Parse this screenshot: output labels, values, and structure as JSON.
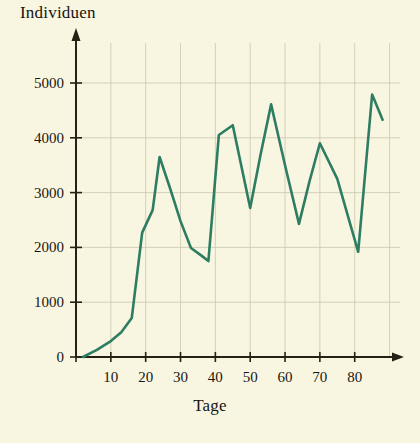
{
  "chart_data": {
    "type": "line",
    "title": "",
    "xlabel": "Tage",
    "ylabel": "Individuen",
    "xlim": [
      0,
      93
    ],
    "ylim": [
      0,
      5600
    ],
    "grid": true,
    "legend": null,
    "line_color": "#2e7d62",
    "background_color": "#f8f6e1",
    "axis_color": "#262015",
    "grid_color": "#c9c8ad",
    "text_color": "#1a1712",
    "xticks": [
      10,
      20,
      30,
      40,
      50,
      60,
      70,
      80
    ],
    "yticks": [
      0,
      1000,
      2000,
      3000,
      4000,
      5000
    ],
    "xtick_labels": [
      "10",
      "20",
      "30",
      "40",
      "50",
      "60",
      "70",
      "80"
    ],
    "ytick_labels": [
      "0",
      "1000",
      "2000",
      "3000",
      "4000",
      "5000"
    ],
    "series": [
      {
        "name": "Individuen",
        "x": [
          2,
          6,
          10,
          13,
          16,
          19,
          22,
          24,
          27,
          30,
          33,
          36,
          38,
          39,
          41,
          45,
          50,
          53,
          56,
          60,
          64,
          67,
          70,
          75,
          81,
          85,
          88
        ],
        "y": [
          0,
          130,
          290,
          450,
          710,
          2270,
          2680,
          3650,
          3080,
          2480,
          1990,
          1850,
          1750,
          2510,
          4050,
          4230,
          2720,
          3700,
          4610,
          3500,
          2430,
          3200,
          3900,
          3250,
          1920,
          4790,
          4330
        ]
      }
    ]
  }
}
